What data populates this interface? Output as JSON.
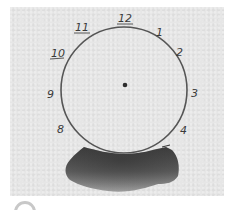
{
  "image": {
    "description": "Scanned hand-drawn clock face on gray paper with a dark watercolor smudge below",
    "colors": {
      "paper": "#e6e6e6",
      "background": "#ffffff",
      "ink": "#4a4a4a",
      "smudge_dark": "#3c3c3c",
      "smudge_light": "#8a8a8a"
    }
  },
  "clock": {
    "center": [
      125,
      88
    ],
    "radius": 63,
    "center_dot": [
      125,
      85
    ],
    "numerals": [
      {
        "label": "12",
        "x": 118,
        "y": 23
      },
      {
        "label": "1",
        "x": 156,
        "y": 36
      },
      {
        "label": "2",
        "x": 176,
        "y": 56
      },
      {
        "label": "3",
        "x": 191,
        "y": 96
      },
      {
        "label": "4",
        "x": 181,
        "y": 134
      },
      {
        "label": "5",
        "x": 162,
        "y": 150
      },
      {
        "label": "8",
        "x": 57,
        "y": 133
      },
      {
        "label": "9",
        "x": 48,
        "y": 98
      },
      {
        "label": "10",
        "x": 51,
        "y": 60
      },
      {
        "label": "11",
        "x": 75,
        "y": 33
      }
    ]
  }
}
